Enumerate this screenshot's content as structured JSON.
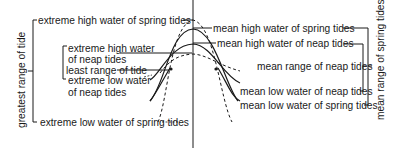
{
  "diagram": {
    "type": "tidal-range-diagram",
    "left_labels": {
      "extreme_high_spring": "extreme high water of spring tides",
      "extreme_high_neap_line1": "extreme high water",
      "extreme_high_neap_line2": "of neap tides",
      "least_range": "least range of tide",
      "extreme_low_neap_line1": "extreme low water",
      "extreme_low_neap_line2": "of neap tides",
      "extreme_low_spring": "extreme low water of spring tides",
      "greatest_range": "greatest range of tide"
    },
    "right_labels": {
      "mean_high_spring": "mean high water of spring tides",
      "mean_high_neap": "mean high water of neap tides",
      "mean_range_neap": "mean range of neap tides",
      "mean_low_neap": "mean low water of neap tides",
      "mean_low_spring": "mean low water of spring tides",
      "mean_range_spring": "mean range of spring tides"
    },
    "colors": {
      "ink": "#1a1a1a",
      "background": "#ffffff"
    }
  }
}
